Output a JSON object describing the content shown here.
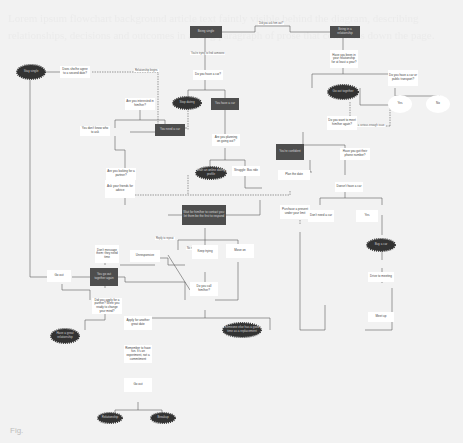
{
  "diagram": {
    "type": "flowchart",
    "background_text": "Lorem ipsum flowchart background article text faintly visible behind the diagram, describing relationships, decisions and outcomes in a long paragraph of prose that continues down the page.",
    "caption": "Fig.",
    "colors": {
      "dark_node": "#4e4e4e",
      "cloud": "#333333",
      "box": "#ffffff",
      "line": "#555555"
    },
    "nodes": {
      "start_a": "Being single",
      "start_b": "Being in a relationship",
      "top_link": "Did you ask him out?",
      "q_single": "You're trying to find someone",
      "q_car": "Do you have a car?",
      "q_partner": "Have you been in your relationship for at least a year?",
      "q_right": "Do you have a car or public transport?",
      "yes_circle": "Yes",
      "no_circle": "No",
      "right_label": "Not a serious enough issue",
      "cloud_left": "Stay single",
      "left_q": "Does she/he agree to a second date?",
      "left_q_label": "Relationship begins",
      "q_interest": "Are you interested in him/her?",
      "cloud_mid": "Stop dating",
      "dark_mid": "You have a car",
      "q_plans": "Are you planning on going out?",
      "dark_mid2": "You need a car",
      "q_partner2": "Are you looking for a partner?",
      "dont_know": "You don't know who to ask",
      "cloud_small": "Start an online dating profile",
      "bus": "Struggle: Bus ride",
      "cloud_right": "Go out together",
      "q_meet": "Do you want to meet him/her again?",
      "dark_right": "You're confident",
      "q_phone": "Have you got their phone number?",
      "plan_date": "Plan the date",
      "chat": "Start a conversation",
      "purchase": "Purchase a present under your limit",
      "q_present": "Doesn't have a car",
      "not_need": "Don't need a car",
      "yes_box": "Yes",
      "cloud_yes": "Buy a car",
      "drive": "Drive to meeting",
      "meet": "Meet up",
      "ask_friends": "Ask your friends for advice",
      "dont_want": "Don't message them: they need time",
      "dark_center": "Wait for him/her to contact you: let them be the first to respond",
      "reply": "Reply to repeat",
      "no_reply": "No reply",
      "unresponsive": "Unresponsive",
      "keep": "Keep trying",
      "move_on": "Move on",
      "q_text": "Do you want to text him/her?",
      "q_call": "Do you call him/her?",
      "dark_left": "You go out together again",
      "go_out": "Go out",
      "q_ready": "Did you apply for a partner? Were you ready to change your mind?",
      "cloud_left2": "Have a great relationship",
      "ready": "Apply for another great date",
      "cloud_sorry": "Someone else has a good time as a replacement",
      "remember": "Remember to have fun. It's an experiment, not a commitment",
      "go": "Go out",
      "cloud_end1": "Relationship",
      "cloud_end2": "Breakup",
      "edge_yes": "Yes",
      "edge_no": "No"
    }
  }
}
